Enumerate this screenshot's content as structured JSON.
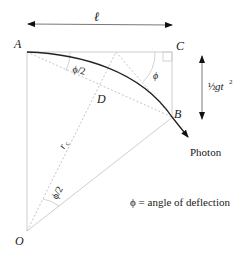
{
  "diagram": {
    "type": "geometry",
    "points": {
      "A": {
        "label": "A",
        "x": 27,
        "y": 52
      },
      "B": {
        "label": "B",
        "x": 172,
        "y": 117
      },
      "C": {
        "label": "C",
        "x": 172,
        "y": 52
      },
      "D": {
        "label": "D",
        "x": 100,
        "y": 88
      },
      "O": {
        "label": "O",
        "x": 27,
        "y": 231
      }
    },
    "labels": {
      "length": "ℓ",
      "drop_frac": "½",
      "drop": "gt",
      "drop_exp": "2",
      "radius": "r",
      "radius_sub": "c",
      "half_angle_top": "ϕ/2",
      "half_angle_bottom": "ϕ/2",
      "angle_c": "ϕ",
      "photon": "Photon",
      "legend": "ϕ = angle of deflection"
    },
    "colors": {
      "curve": "#222222",
      "construction": "#c8c8c8",
      "dotted": "#bdbdbd",
      "arrow": "#111111",
      "text": "#1a1a1a"
    }
  }
}
